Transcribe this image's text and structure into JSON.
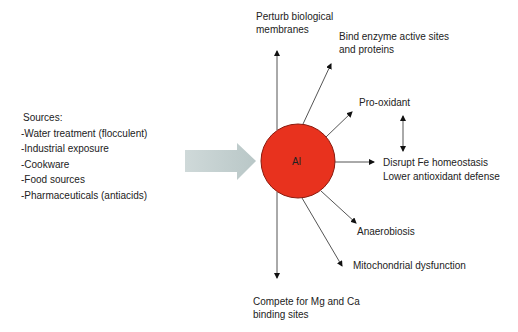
{
  "sources": {
    "title": "Sources:",
    "items": [
      "-Water treatment (flocculent)",
      "-Industrial exposure",
      "-Cookware",
      "-Food sources",
      "-Pharmaceuticals (antiacids)"
    ]
  },
  "center": {
    "label": "Al",
    "color": "#e8321e",
    "stroke": "#8a1a0e"
  },
  "input_arrow": {
    "color": "#c4d0d0"
  },
  "effects": {
    "perturb": [
      "Perturb biological",
      "membranes"
    ],
    "bind": [
      "Bind enzyme active sites",
      "and proteins"
    ],
    "prooxidant": "Pro-oxidant",
    "disrupt": [
      "Disrupt Fe homeostasis",
      "Lower antioxidant defense"
    ],
    "anaerobiosis": "Anaerobiosis",
    "mito": "Mitochondrial dysfunction",
    "compete": [
      "Compete for Mg and Ca",
      "binding sites"
    ]
  }
}
